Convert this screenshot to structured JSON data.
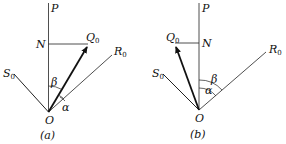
{
  "figure": {
    "panels": [
      {
        "id": "a",
        "caption": "(a)",
        "labels": {
          "P": "P",
          "N": "N",
          "Q": "Q",
          "Q_sub": "0",
          "R": "R",
          "R_sub": "0",
          "S": "S",
          "S_sub": "0",
          "O": "O",
          "alpha": "α",
          "beta": "β"
        }
      },
      {
        "id": "b",
        "caption": "(b)",
        "labels": {
          "P": "P",
          "N": "N",
          "Q": "Q",
          "Q_sub": "0",
          "R": "R",
          "R_sub": "0",
          "S": "S",
          "S_sub": "0",
          "O": "O",
          "alpha": "α",
          "beta": "β"
        }
      }
    ],
    "colors": {
      "line": "#222222",
      "background": "#ffffff"
    }
  }
}
